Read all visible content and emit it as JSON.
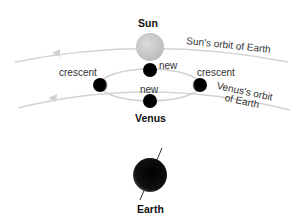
{
  "labels": {
    "sun": "Sun",
    "sun_orbit": "Sun's orbit of Earth",
    "venus_orbit_line1": "Venus's orbit",
    "venus_orbit_line2": "of Earth",
    "crescent_left": "crescent",
    "crescent_right": "crescent",
    "new_top": "new",
    "new_bottom": "new",
    "venus": "Venus",
    "earth": "Earth"
  },
  "colors": {
    "orbit_line": "#cfcfcf",
    "sun": "#c9c9c9",
    "body": "#000000"
  }
}
